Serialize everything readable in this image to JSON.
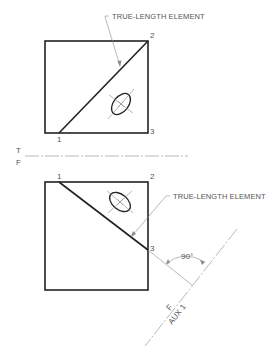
{
  "diagram": {
    "type": "descriptive-geometry-auxiliary-view",
    "top_view": {
      "annotation": "TRUE-LENGTH ELEMENT",
      "points": [
        {
          "label": "1"
        },
        {
          "label": "2"
        },
        {
          "label": "3"
        }
      ]
    },
    "fold_line_top_front": {
      "upper_label": "T",
      "lower_label": "F"
    },
    "front_view": {
      "annotation": "TRUE-LENGTH ELEMENT",
      "points": [
        {
          "label": "1"
        },
        {
          "label": "2"
        },
        {
          "label": "3"
        }
      ]
    },
    "auxiliary_fold_line": {
      "upper_label": "F",
      "lower_label": "AUX 1",
      "angle_label": "90°"
    },
    "colors": {
      "object_line": "#222222",
      "thin_line": "#8a8a8a",
      "text": "#555555"
    }
  }
}
